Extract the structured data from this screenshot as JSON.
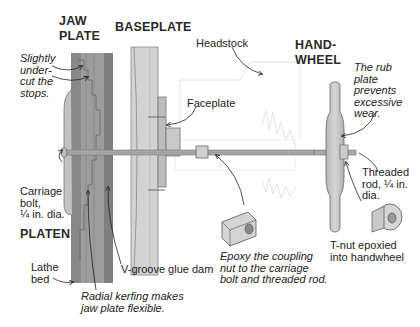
{
  "diagram": {
    "type": "woodworking-jig-illustration",
    "headings": {
      "jaw_plate_line1": "JAW",
      "jaw_plate_line2": "PLATE",
      "baseplate": "BASEPLATE",
      "handwheel_line1": "HAND-",
      "handwheel_line2": "WHEEL",
      "platen": "PLATEN"
    },
    "callouts": {
      "undercut": "Slightly\nunder-\ncut the\nstops.",
      "headstock": "Headstock",
      "faceplate": "Faceplate",
      "rub_plate": "The rub\nplate\nprevents\nexcessive\nwear.",
      "carriage_bolt": "Carriage\nbolt,\n¼ in. dia.",
      "threaded_rod": "Threaded\nrod, ¼ in.\ndia.",
      "lathe_bed": "Lathe\nbed",
      "v_groove": "V-groove glue dam",
      "coupling_nut": "Epoxy the coupling\nnut to the carriage\nbolt and threaded rod.",
      "t_nut": "T-nut epoxied\ninto handwheel",
      "radial_kerfing": "Radial kerfing makes\njaw plate flexible."
    },
    "colors": {
      "jaw_plate_dark": "#8f8f8f",
      "jaw_plate_mid": "#a9a9a9",
      "baseplate": "#cfcfcf",
      "handwheel": "#c4c4c4",
      "rod": "#a0a0a0",
      "ghost_outline": "#e2e2e2",
      "text": "#222222"
    }
  }
}
